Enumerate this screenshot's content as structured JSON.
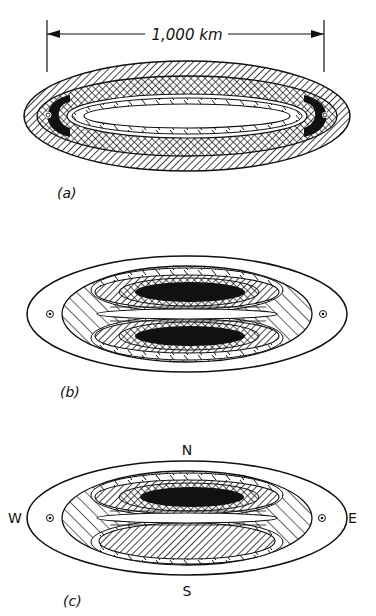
{
  "figure": {
    "panels": [
      {
        "id": "a",
        "label": "(a)",
        "scale_label": "1,000 km"
      },
      {
        "id": "b",
        "label": "(b)"
      },
      {
        "id": "c",
        "label": "(c)",
        "compass": {
          "north": "N",
          "south": "S",
          "west": "W",
          "east": "E"
        }
      }
    ]
  },
  "colors": {
    "ink": "#111111",
    "background": "#ffffff"
  }
}
